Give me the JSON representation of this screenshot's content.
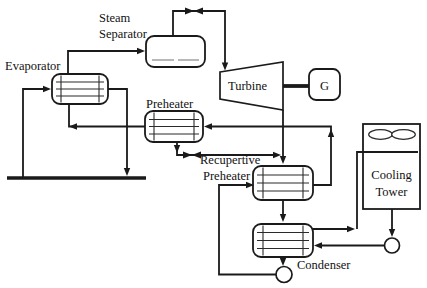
{
  "diagram": {
    "type": "process-flow-diagram",
    "labels": {
      "steam_separator_line1": "Steam",
      "steam_separator_line2": "Separator",
      "evaporator": "Evaporator",
      "preheater": "Preheater",
      "turbine": "Turbine",
      "generator": "G",
      "recuperative_preheater_line1": "Recupertive",
      "recuperative_preheater_line2": "Preheater",
      "cooling_tower_line1": "Cooling",
      "cooling_tower_line2": "Tower",
      "condenser": "Condenser"
    },
    "icons": {
      "valve": "valve-icon (two facing triangles)",
      "pump": "pump-icon (circle)",
      "fan": "fan-icon (twin ellipses)",
      "ground": "ground-line (thick bar)"
    },
    "colors": {
      "line": "#1a1a1a",
      "background": "#ffffff",
      "vessel_level": "#9a9a9a"
    }
  }
}
